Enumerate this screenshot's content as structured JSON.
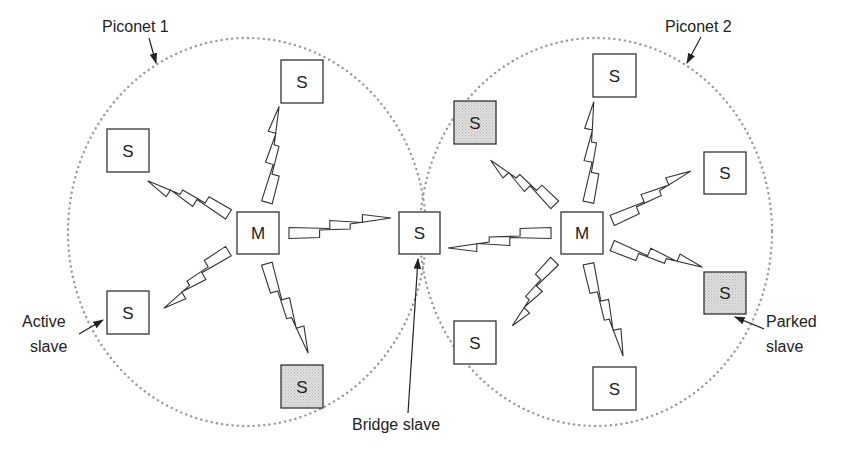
{
  "diagram": {
    "colors": {
      "active_fill": "#ffffff",
      "parked_fill": "#d9d9d9",
      "outline": "#333333",
      "range_dots": "#999999"
    },
    "piconets": [
      {
        "id": "p1",
        "label": "Piconet 1",
        "cx": 247,
        "cy": 232,
        "rx": 179,
        "ry": 194
      },
      {
        "id": "p2",
        "label": "Piconet 2",
        "cx": 596,
        "cy": 232,
        "rx": 176,
        "ry": 194
      }
    ],
    "nodes": [
      {
        "id": "m1",
        "label": "M",
        "role": "master",
        "state": "active",
        "x": 237,
        "y": 212,
        "w": 42,
        "h": 42
      },
      {
        "id": "p1-top",
        "label": "S",
        "role": "slave",
        "state": "active",
        "x": 281,
        "y": 60,
        "w": 42,
        "h": 43
      },
      {
        "id": "p1-left",
        "label": "S",
        "role": "slave",
        "state": "active",
        "x": 107,
        "y": 129,
        "w": 42,
        "h": 43
      },
      {
        "id": "p1-active",
        "label": "S",
        "role": "slave",
        "state": "active",
        "x": 107,
        "y": 291,
        "w": 42,
        "h": 43
      },
      {
        "id": "p1-bottom",
        "label": "S",
        "role": "slave",
        "state": "parked",
        "x": 281,
        "y": 365,
        "w": 42,
        "h": 43
      },
      {
        "id": "bridge",
        "label": "S",
        "role": "bridge slave",
        "state": "active",
        "x": 399,
        "y": 212,
        "w": 41,
        "h": 42
      },
      {
        "id": "m2",
        "label": "M",
        "role": "master",
        "state": "active",
        "x": 561,
        "y": 212,
        "w": 42,
        "h": 42
      },
      {
        "id": "p2-topleft",
        "label": "S",
        "role": "slave",
        "state": "parked",
        "x": 454,
        "y": 101,
        "w": 42,
        "h": 43
      },
      {
        "id": "p2-top",
        "label": "S",
        "role": "slave",
        "state": "active",
        "x": 593,
        "y": 54,
        "w": 43,
        "h": 43
      },
      {
        "id": "p2-right",
        "label": "S",
        "role": "slave",
        "state": "active",
        "x": 704,
        "y": 152,
        "w": 42,
        "h": 42
      },
      {
        "id": "p2-parked",
        "label": "S",
        "role": "slave",
        "state": "parked",
        "x": 704,
        "y": 272,
        "w": 42,
        "h": 42
      },
      {
        "id": "p2-bottomleft",
        "label": "S",
        "role": "slave",
        "state": "active",
        "x": 454,
        "y": 321,
        "w": 42,
        "h": 43
      },
      {
        "id": "p2-bottom",
        "label": "S",
        "role": "slave",
        "state": "active",
        "x": 593,
        "y": 367,
        "w": 43,
        "h": 43
      }
    ],
    "links": [
      {
        "from": "m1",
        "to": "p1-top"
      },
      {
        "from": "m1",
        "to": "p1-left"
      },
      {
        "from": "m1",
        "to": "p1-active"
      },
      {
        "from": "m1",
        "to": "p1-bottom"
      },
      {
        "from": "m1",
        "to": "bridge"
      },
      {
        "from": "m2",
        "to": "bridge"
      },
      {
        "from": "m2",
        "to": "p2-topleft"
      },
      {
        "from": "m2",
        "to": "p2-top"
      },
      {
        "from": "m2",
        "to": "p2-right"
      },
      {
        "from": "m2",
        "to": "p2-parked"
      },
      {
        "from": "m2",
        "to": "p2-bottomleft"
      },
      {
        "from": "m2",
        "to": "p2-bottom"
      }
    ],
    "annotations": {
      "piconet1": "Piconet 1",
      "piconet2": "Piconet 2",
      "active_slave_line1": "Active",
      "active_slave_line2": "slave",
      "parked_slave_line1": "Parked",
      "parked_slave_line2": "slave",
      "bridge_slave": "Bridge slave"
    }
  }
}
